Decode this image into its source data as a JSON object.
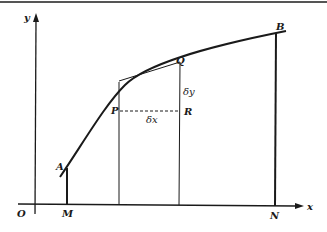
{
  "diagram": {
    "axes": {
      "x_label": "x",
      "y_label": "y",
      "origin_label": "O"
    },
    "points": {
      "A": "A",
      "B": "B",
      "P": "P",
      "Q": "Q",
      "R": "R",
      "M": "M",
      "N": "N"
    },
    "increments": {
      "dx": "δx",
      "dy": "δy"
    },
    "colors": {
      "ink": "#1a1a1a",
      "background": "#ffffff"
    }
  }
}
